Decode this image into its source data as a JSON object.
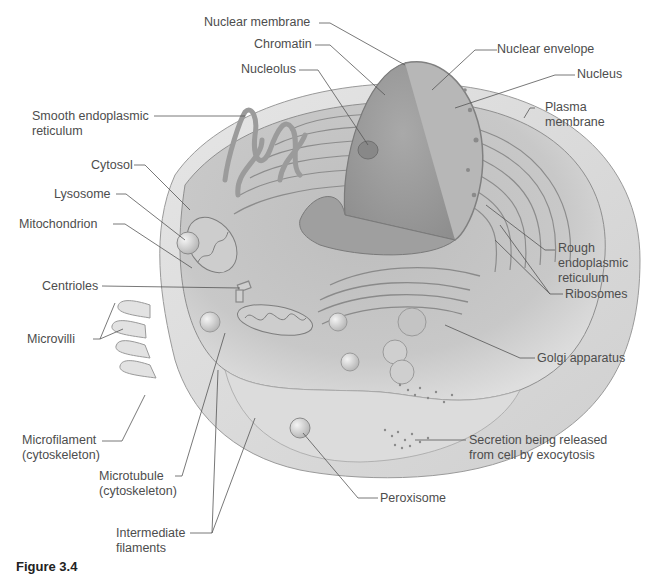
{
  "figure": {
    "caption": "Figure 3.4"
  },
  "colors": {
    "background": "#ffffff",
    "cell_body": "#c9c9c9",
    "cell_dark": "#a8a8a8",
    "nucleus": "#9a9a9a",
    "membrane": "#e4e4e4",
    "label_text": "#4d4d4d",
    "leader_line": "#555555"
  },
  "labels": {
    "nuclear_membrane": "Nuclear membrane",
    "chromatin": "Chromatin",
    "nucleolus": "Nucleolus",
    "nuclear_envelope": "Nuclear envelope",
    "nucleus": "Nucleus",
    "plasma_membrane_1": "Plasma",
    "plasma_membrane_2": "membrane",
    "smooth_er_1": "Smooth endoplasmic",
    "smooth_er_2": "reticulum",
    "cytosol": "Cytosol",
    "lysosome": "Lysosome",
    "mitochondrion": "Mitochondrion",
    "centrioles": "Centrioles",
    "microvilli": "Microvilli",
    "rough_er_1": "Rough",
    "rough_er_2": "endoplasmic",
    "rough_er_3": "reticulum",
    "ribosomes": "Ribosomes",
    "golgi": "Golgi apparatus",
    "microfilament_1": "Microfilament",
    "microfilament_2": "(cytoskeleton)",
    "microtubule_1": "Microtubule",
    "microtubule_2": "(cytoskeleton)",
    "secretion_1": "Secretion being released",
    "secretion_2": "from cell by exocytosis",
    "peroxisome": "Peroxisome",
    "intermediate_1": "Intermediate",
    "intermediate_2": "filaments"
  }
}
